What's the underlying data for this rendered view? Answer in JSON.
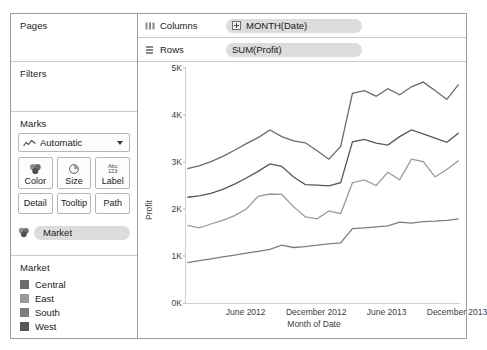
{
  "cards": {
    "pages": {
      "title": "Pages"
    },
    "filters": {
      "title": "Filters"
    },
    "marks": {
      "title": "Marks",
      "mark_type": "Automatic",
      "mark_type_icon": "line-chart-icon",
      "buttons": [
        {
          "label": "Color",
          "icon": "color-palette-icon"
        },
        {
          "label": "Size",
          "icon": "size-pie-icon"
        },
        {
          "label": "Label",
          "icon": "abc-123-icon"
        },
        {
          "label": "Detail",
          "icon": "detail-icon"
        },
        {
          "label": "Tooltip",
          "icon": "tooltip-icon"
        },
        {
          "label": "Path",
          "icon": "path-icon"
        }
      ],
      "pill": {
        "label": "Market",
        "icon": "color-palette-icon"
      }
    },
    "legend": {
      "title": "Market",
      "items": [
        {
          "label": "Central",
          "color": "#6b6b6b"
        },
        {
          "label": "East",
          "color": "#9a9a9a"
        },
        {
          "label": "South",
          "color": "#7d7d7d"
        },
        {
          "label": "West",
          "color": "#575757"
        }
      ]
    }
  },
  "shelves": {
    "columns": {
      "name": "Columns",
      "icon": "columns-icon",
      "pill": "MONTH(Date)",
      "expander": "plus-expander-icon"
    },
    "rows": {
      "name": "Rows",
      "icon": "rows-icon",
      "pill": "SUM(Profit)"
    }
  },
  "chart_data": {
    "type": "line",
    "title": "",
    "xlabel": "Month of Date",
    "ylabel": "Profit",
    "ylim": [
      0,
      5000
    ],
    "yticks": [
      0,
      1000,
      2000,
      3000,
      4000,
      5000
    ],
    "ytick_labels": [
      "0K",
      "1K",
      "2K",
      "3K",
      "4K",
      "5K"
    ],
    "grid": false,
    "legend_position": "left-panel",
    "xtick_labels": [
      "June 2012",
      "December 2012",
      "June 2013",
      "December 2013"
    ],
    "xtick_x": [
      5,
      11,
      17,
      23
    ],
    "x": [
      0,
      1,
      2,
      3,
      4,
      5,
      6,
      7,
      8,
      9,
      10,
      11,
      12,
      13,
      14,
      15,
      16,
      17,
      18,
      19,
      20,
      21,
      22,
      23
    ],
    "series": [
      {
        "name": "Central",
        "color": "#6b6b6b",
        "values": [
          2860,
          2920,
          3010,
          3120,
          3250,
          3390,
          3520,
          3680,
          3540,
          3450,
          3410,
          3240,
          3060,
          3330,
          4460,
          4520,
          4400,
          4560,
          4430,
          4600,
          4700,
          4520,
          4330,
          4650
        ]
      },
      {
        "name": "West",
        "color": "#575757",
        "values": [
          2250,
          2280,
          2330,
          2420,
          2530,
          2660,
          2800,
          2960,
          2910,
          2680,
          2520,
          2510,
          2490,
          2560,
          3430,
          3480,
          3400,
          3360,
          3540,
          3680,
          3600,
          3510,
          3420,
          3620
        ]
      },
      {
        "name": "South",
        "color": "#9a9a9a",
        "values": [
          1650,
          1600,
          1680,
          1760,
          1860,
          2000,
          2270,
          2320,
          2310,
          2050,
          1830,
          1790,
          1960,
          1900,
          2560,
          2620,
          2500,
          2780,
          2620,
          3060,
          3010,
          2680,
          2840,
          3030
        ]
      },
      {
        "name": "East",
        "color": "#7d7d7d",
        "values": [
          860,
          900,
          940,
          980,
          1020,
          1060,
          1100,
          1140,
          1230,
          1180,
          1200,
          1230,
          1260,
          1280,
          1580,
          1600,
          1620,
          1640,
          1720,
          1700,
          1730,
          1740,
          1760,
          1790
        ]
      }
    ]
  }
}
